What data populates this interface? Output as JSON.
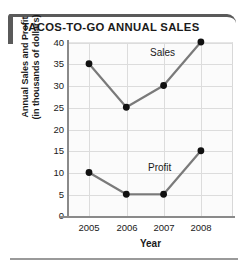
{
  "header": {
    "title": "TACOS-TO-GO ANNUAL SALES",
    "accent_color": "#5a5a5a"
  },
  "axes": {
    "x_title": "Year",
    "y_title_line1": "Annual Sales and Profit",
    "y_title_line2": "(in thousands of dollars)"
  },
  "labels": {
    "sales": "Sales",
    "profit": "Profit"
  },
  "yticks": [
    "40",
    "35",
    "30",
    "25",
    "20",
    "15",
    "10",
    "5",
    "0"
  ],
  "xticks": [
    "2005",
    "2006",
    "2007",
    "2008"
  ],
  "chart_data": {
    "type": "line",
    "title": "TACOS-TO-GO ANNUAL SALES",
    "xlabel": "Year",
    "ylabel": "Annual Sales and Profit (in thousands of dollars)",
    "categories": [
      "2005",
      "2006",
      "2007",
      "2008"
    ],
    "series": [
      {
        "name": "Sales",
        "values": [
          35,
          25,
          30,
          40
        ],
        "color": "#7a7a7a",
        "marker_color": "#111111"
      },
      {
        "name": "Profit",
        "values": [
          10,
          5,
          5,
          15
        ],
        "color": "#7a7a7a",
        "marker_color": "#111111"
      }
    ],
    "ylim": [
      0,
      40
    ],
    "ytick_step": 5,
    "grid": true,
    "legend": "inline-annotations"
  }
}
